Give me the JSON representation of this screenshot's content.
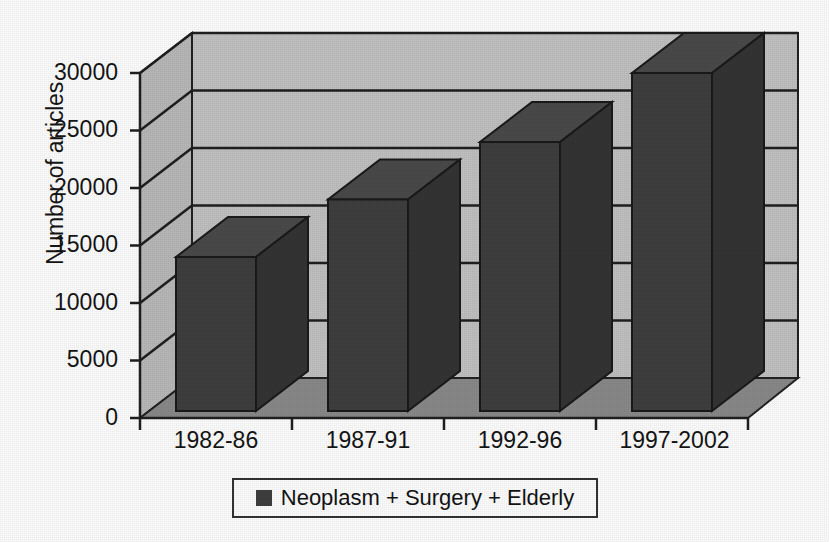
{
  "chart_data": {
    "type": "bar",
    "title": "",
    "subtitle": "",
    "xlabel": "",
    "ylabel": "Number of articles",
    "categories": [
      "1982-86",
      "1987-91",
      "1992-96",
      "1997-2002"
    ],
    "series": [
      {
        "name": "Neoplasm + Surgery + Elderly",
        "values": [
          14000,
          19000,
          24000,
          30000
        ],
        "color": "#3f3f3f"
      }
    ],
    "ylim": [
      0,
      32500
    ],
    "yticks": [
      0,
      5000,
      10000,
      15000,
      20000,
      25000,
      30000
    ],
    "ytick_labels": [
      "0",
      "5000",
      "10000",
      "15000",
      "20000",
      "25000",
      "30000"
    ],
    "grid": true,
    "grid_axis": "y",
    "legend_position": "bottom",
    "style": "3d-perspective-bar",
    "colors": {
      "back_wall": "#c2c2c2",
      "side_wall": "#b8b8b8",
      "floor": "#8a8a8a",
      "bar_front": "#3f3f3f",
      "bar_top": "#4a4a4a",
      "bar_side": "#343434",
      "axis_line": "#222222",
      "grid_line": "#1f1f1f",
      "background": "#ffffff"
    }
  },
  "axes": {
    "y_title": "Number of articles",
    "y_tick_labels": [
      "30000",
      "25000",
      "20000",
      "15000",
      "10000",
      "5000",
      "0"
    ],
    "x_tick_labels": [
      "1982-86",
      "1987-91",
      "1992-96",
      "1997-2002"
    ]
  },
  "legend": {
    "entries": [
      {
        "label": "Neoplasm + Surgery + Elderly",
        "swatch_color": "#3f3f3f"
      }
    ]
  }
}
